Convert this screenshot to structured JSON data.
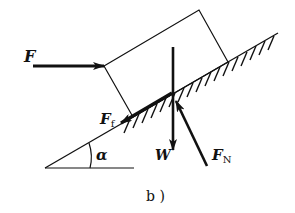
{
  "figure": {
    "caption": "b )",
    "labels": {
      "applied_force": "F",
      "friction_main": "F",
      "friction_sub": "f",
      "weight": "W",
      "normal_main": "F",
      "normal_sub": "N",
      "angle": "α"
    },
    "colors": {
      "ink": "#111111",
      "background": "#ffffff"
    }
  }
}
